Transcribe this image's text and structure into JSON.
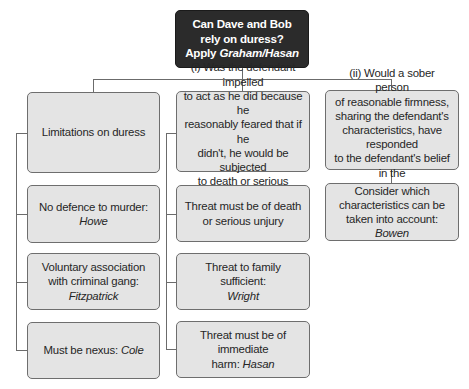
{
  "root": {
    "line1": "Can Dave and Bob",
    "line2": "rely on duress?",
    "line3_prefix": "Apply ",
    "line3_case": "Graham/Hasan"
  },
  "columns": [
    {
      "header": {
        "text": "Limitations on duress"
      },
      "items": [
        {
          "text": "No defence to murder:",
          "case": "Howe"
        },
        {
          "text": "Voluntary association with criminal gang:",
          "line1": "Voluntary association",
          "line2": "with criminal gang:",
          "case": "Fitzpatrick"
        },
        {
          "text": "Must be nexus: ",
          "case": "Cole"
        }
      ]
    },
    {
      "header": {
        "lines": [
          "(i) Was the defendant impelled",
          "to act as he did because he",
          "reasonably feared that if he",
          "didn't, he would be subjected",
          "to death or serious",
          "personal injury?"
        ]
      },
      "items": [
        {
          "line1": "Threat must be of death",
          "line2": "or serious unjury"
        },
        {
          "text": "Threat to family sufficient:",
          "case": "Wright"
        },
        {
          "line1": "Threat must be of immediate",
          "line2_prefix": "harm: ",
          "case": "Hasan"
        }
      ]
    },
    {
      "header": {
        "lines": [
          "(ii) Would a sober person",
          "of reasonable firmness,",
          "sharing the defendant's",
          "characteristics, have responded",
          "to the defendant's belief in the",
          "same way?"
        ]
      },
      "items": [
        {
          "line1": "Consider which",
          "line2": "characteristics can be",
          "line3": "taken into account:",
          "case": "Bowen"
        }
      ]
    }
  ],
  "colors": {
    "root_fill": "#2b2b2b",
    "box_fill": "#e4e4e4",
    "connector": "#6b6b6b",
    "text": "#262626"
  }
}
